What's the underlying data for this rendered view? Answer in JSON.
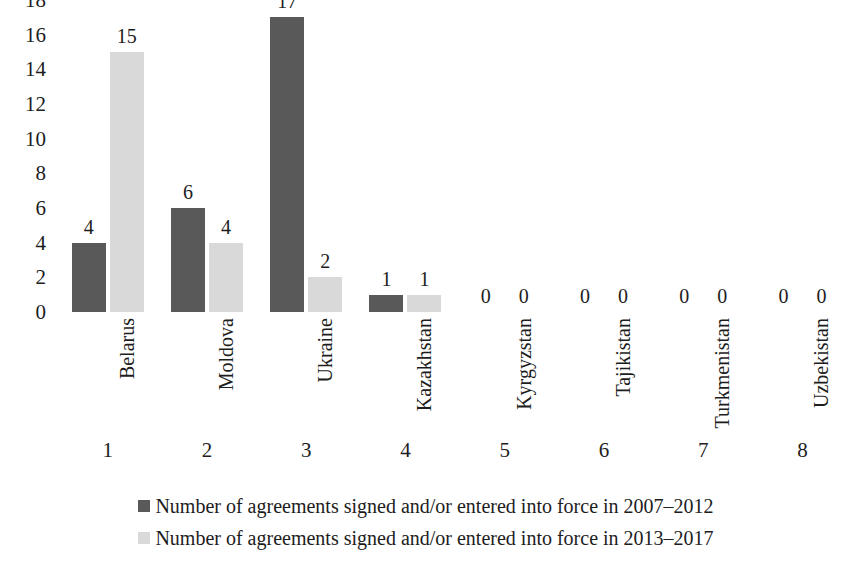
{
  "chart_data": {
    "type": "bar",
    "title": "",
    "subtitle": "",
    "xlabel": "",
    "ylabel": "",
    "ylim": [
      0,
      18
    ],
    "ytick_step": 2,
    "yticks": [
      "18",
      "16",
      "14",
      "12",
      "10",
      "8",
      "6",
      "4",
      "2",
      "0"
    ],
    "grid": false,
    "legend_position": "bottom",
    "categories": [
      "Belarus",
      "Moldova",
      "Ukraine",
      "Kazakhstan",
      "Kyrgyzstan",
      "Tajikistan",
      "Turkmenistan",
      "Uzbekistan"
    ],
    "category_indices": [
      "1",
      "2",
      "3",
      "4",
      "5",
      "6",
      "7",
      "8"
    ],
    "series": [
      {
        "name": "Number of agreements signed and/or entered into force in 2007–2012",
        "color": "#595959",
        "values": [
          4,
          6,
          17,
          1,
          0,
          0,
          0,
          0
        ],
        "value_labels": [
          "4",
          "6",
          "17",
          "1",
          "0",
          "0",
          "0",
          "0"
        ]
      },
      {
        "name": "Number of agreements signed and/or entered into force in 2013–2017",
        "color": "#d9d9d9",
        "values": [
          15,
          4,
          2,
          1,
          0,
          0,
          0,
          0
        ],
        "value_labels": [
          "15",
          "4",
          "2",
          "1",
          "0",
          "0",
          "0",
          "0"
        ]
      }
    ]
  },
  "colors": {
    "series_1": "#595959",
    "series_2": "#d9d9d9",
    "background": "#ffffff",
    "text": "#1d1d1d"
  }
}
